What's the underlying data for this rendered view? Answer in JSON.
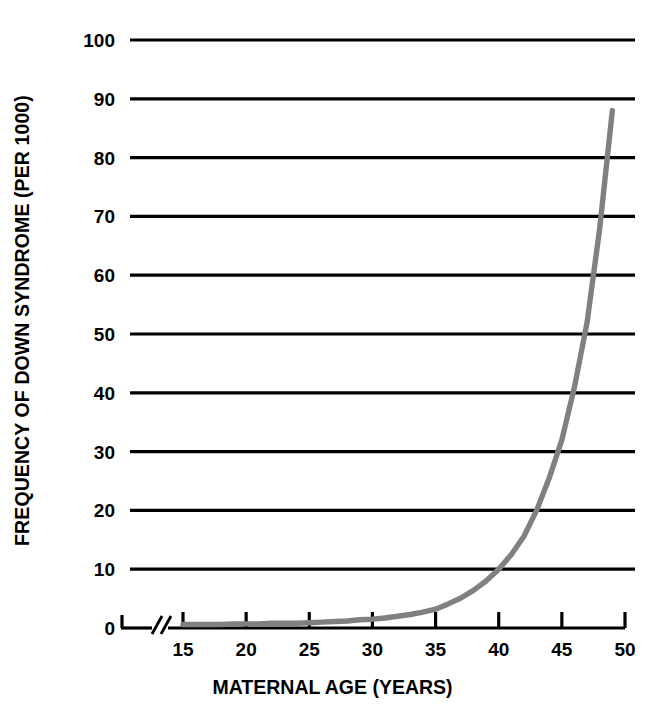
{
  "chart_data": {
    "type": "line",
    "title": "",
    "xlabel": "MATERNAL AGE (YEARS)",
    "ylabel": "FREQUENCY OF DOWN SYNDROME (PER 1000)",
    "xlim": [
      13,
      50
    ],
    "ylim": [
      0,
      100
    ],
    "grid": "horizontal",
    "legend": "none",
    "axis_break": "x-axis break between origin and 15",
    "line_color": "#808080",
    "axis_color": "#000000",
    "background_color": "#ffffff",
    "xticks": [
      15,
      20,
      25,
      30,
      35,
      40,
      45,
      50
    ],
    "xtick_labels": [
      "15",
      "20",
      "25",
      "30",
      "35",
      "40",
      "45",
      "50"
    ],
    "yticks": [
      0,
      10,
      20,
      30,
      40,
      50,
      60,
      70,
      80,
      90,
      100
    ],
    "ytick_labels": [
      "0",
      "10",
      "20",
      "30",
      "40",
      "50",
      "60",
      "70",
      "80",
      "90",
      "100"
    ],
    "series": [
      {
        "name": "Down syndrome frequency",
        "x": [
          15,
          16,
          17,
          18,
          19,
          20,
          21,
          22,
          23,
          24,
          25,
          26,
          27,
          28,
          29,
          30,
          31,
          32,
          33,
          34,
          35,
          36,
          37,
          38,
          39,
          40,
          41,
          42,
          43,
          44,
          45,
          46,
          47,
          48,
          49
        ],
        "values": [
          0.6,
          0.6,
          0.6,
          0.6,
          0.7,
          0.7,
          0.7,
          0.8,
          0.8,
          0.8,
          0.9,
          1.0,
          1.1,
          1.2,
          1.4,
          1.5,
          1.7,
          2.0,
          2.3,
          2.7,
          3.2,
          4.1,
          5.1,
          6.4,
          8.0,
          10.0,
          12.5,
          15.6,
          20.0,
          25.5,
          32.0,
          41.0,
          52.0,
          68.0,
          88.0
        ]
      }
    ]
  },
  "axis_titles": {
    "y": "FREQUENCY OF DOWN SYNDROME (PER 1000)",
    "x": "MATERNAL AGE (YEARS)"
  }
}
